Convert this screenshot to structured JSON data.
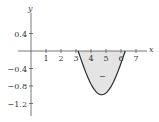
{
  "chart_data": {
    "type": "area",
    "title": "",
    "function": "y = sin(x)",
    "shaded_interval": [
      3.1416,
      6.2832
    ],
    "region_sign_label": "−",
    "xlabel": "x",
    "ylabel": "y",
    "xlim": [
      -0.9,
      7.7
    ],
    "ylim": [
      -1.4,
      0.8
    ],
    "x_ticks": [
      1,
      2,
      3,
      4,
      5,
      6,
      7
    ],
    "x_tick_labels": [
      "1",
      "2",
      "3",
      "4",
      "5",
      "6",
      "7"
    ],
    "y_ticks": [
      0.4,
      -0.4,
      -0.8,
      -1.2
    ],
    "y_tick_labels": [
      "0.4",
      "−0.4",
      "−0.8",
      "−1.2"
    ],
    "grid": false,
    "legend": null,
    "x": [
      3.1416,
      3.5343,
      3.927,
      4.3197,
      4.7124,
      5.1051,
      5.4978,
      5.8905,
      6.2832
    ],
    "values": [
      0,
      -0.3827,
      -0.7071,
      -0.9239,
      -1.0,
      -0.9239,
      -0.7071,
      -0.3827,
      0
    ],
    "colors": {
      "fill": "#e4e4e4",
      "curve": "#2b2b2b",
      "axis": "#555555"
    }
  }
}
